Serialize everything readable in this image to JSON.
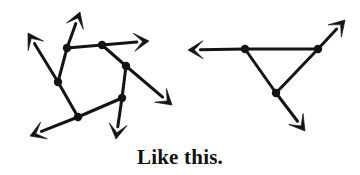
{
  "figure": {
    "caption": "Like this.",
    "background_color": "#ffffff",
    "stroke_color": "#141414",
    "vertex_color": "#141414",
    "stroke_width": 3,
    "vertex_radius": 4.2,
    "arrow_head_length": 15,
    "arrow_head_width": 9,
    "diagrams": [
      {
        "name": "left-graph",
        "description": "Six-vertex cyclic graph with six outward arrows",
        "vertices": [
          {
            "id": "L1",
            "x": 67,
            "y": 48
          },
          {
            "id": "L2",
            "x": 102,
            "y": 45
          },
          {
            "id": "L3",
            "x": 126,
            "y": 66
          },
          {
            "id": "L4",
            "x": 122,
            "y": 98
          },
          {
            "id": "L5",
            "x": 78,
            "y": 117
          },
          {
            "id": "L6",
            "x": 58,
            "y": 82
          }
        ],
        "edges": [
          {
            "from": "L1",
            "to": "L2"
          },
          {
            "from": "L2",
            "to": "L3"
          },
          {
            "from": "L3",
            "to": "L4"
          },
          {
            "from": "L4",
            "to": "L5"
          },
          {
            "from": "L5",
            "to": "L6"
          },
          {
            "from": "L6",
            "to": "L1"
          }
        ],
        "arrows": [
          {
            "name": "up-arrow",
            "from": "L1",
            "tip_x": 80,
            "tip_y": 12
          },
          {
            "name": "upper-left-arrow",
            "from": "L6",
            "tip_x": 28,
            "tip_y": 33
          },
          {
            "name": "right-arrow",
            "from": "L2",
            "tip_x": 149,
            "tip_y": 41
          },
          {
            "name": "lower-right-arrow",
            "from": "L3",
            "tip_x": 172,
            "tip_y": 105
          },
          {
            "name": "down-arrow",
            "from": "L4",
            "tip_x": 116,
            "tip_y": 139
          },
          {
            "name": "lower-left-arrow",
            "from": "L5",
            "tip_x": 30,
            "tip_y": 136
          }
        ]
      },
      {
        "name": "right-graph",
        "description": "Three-vertex triangle graph with three outward arrows",
        "vertices": [
          {
            "id": "R1",
            "x": 245,
            "y": 49
          },
          {
            "id": "R2",
            "x": 318,
            "y": 49
          },
          {
            "id": "R3",
            "x": 276,
            "y": 93
          }
        ],
        "edges": [
          {
            "from": "R1",
            "to": "R2"
          },
          {
            "from": "R2",
            "to": "R3"
          },
          {
            "from": "R3",
            "to": "R1"
          }
        ],
        "arrows": [
          {
            "name": "left-arrow",
            "from": "R1",
            "tip_x": 188,
            "tip_y": 50
          },
          {
            "name": "upper-right-arrow",
            "from": "R2",
            "tip_x": 345,
            "tip_y": 20
          },
          {
            "name": "lower-right-arrow",
            "from": "R3",
            "tip_x": 305,
            "tip_y": 131
          }
        ]
      }
    ]
  }
}
